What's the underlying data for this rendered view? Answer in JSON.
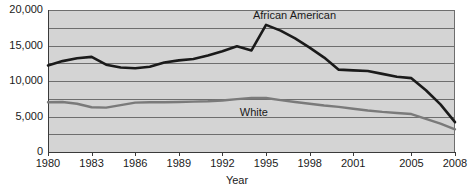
{
  "chart_data": {
    "type": "line",
    "title": "",
    "xlabel": "Year",
    "ylabel": "",
    "xlim": [
      1980,
      2008
    ],
    "ylim": [
      0,
      20000
    ],
    "grid": true,
    "grid_interval": 2500,
    "legend_position": "inline-annotation",
    "x": [
      1980,
      1981,
      1982,
      1983,
      1984,
      1985,
      1986,
      1987,
      1988,
      1989,
      1990,
      1991,
      1992,
      1993,
      1994,
      1995,
      1996,
      1997,
      1998,
      1999,
      2000,
      2001,
      2002,
      2003,
      2004,
      2005,
      2006,
      2007,
      2008
    ],
    "ytick_labels": [
      "0",
      "5,000",
      "10,000",
      "15,000",
      "20,000"
    ],
    "ytick_values": [
      0,
      5000,
      10000,
      15000,
      20000
    ],
    "xtick_labels": [
      "1980",
      "1983",
      "1986",
      "1989",
      "1992",
      "1995",
      "1998",
      "2001",
      "2005",
      "2008"
    ],
    "xtick_values": [
      1980,
      1983,
      1986,
      1989,
      1992,
      1995,
      1998,
      2001,
      2005,
      2008
    ],
    "series": [
      {
        "name": "African American",
        "color": "#1a1a1a",
        "width": 2.6,
        "label_x": 1994.1,
        "label_y": 19100,
        "values": [
          12200,
          12800,
          13200,
          13400,
          12300,
          11900,
          11800,
          12000,
          12600,
          12900,
          13100,
          13600,
          14200,
          14900,
          14300,
          17900,
          17100,
          16000,
          14700,
          13300,
          11600,
          11500,
          11400,
          11000,
          10600,
          10400,
          8700,
          6700,
          4200
        ]
      },
      {
        "name": "White",
        "color": "#7a7a7a",
        "width": 2.4,
        "label_x": 1993.2,
        "label_y": 5500,
        "values": [
          7000,
          7050,
          6800,
          6300,
          6250,
          6600,
          6950,
          7000,
          7000,
          7050,
          7100,
          7150,
          7250,
          7450,
          7600,
          7600,
          7300,
          7050,
          6800,
          6550,
          6350,
          6100,
          5850,
          5650,
          5500,
          5350,
          4650,
          4000,
          3200
        ]
      }
    ],
    "plot_bg": "#d4d4d4",
    "grid_color": "#6e6e6e",
    "axis_color": "#3a3a3a"
  }
}
